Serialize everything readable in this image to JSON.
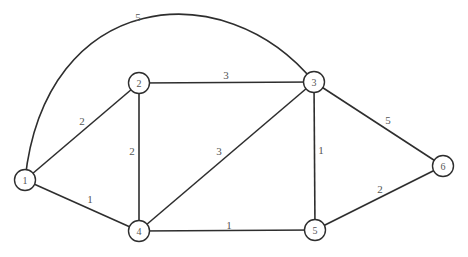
{
  "diagram": {
    "type": "weighted-undirected-graph",
    "nodes": [
      {
        "id": "1",
        "label": "1",
        "x": 25,
        "y": 180
      },
      {
        "id": "2",
        "label": "2",
        "x": 139,
        "y": 83
      },
      {
        "id": "3",
        "label": "3",
        "x": 314,
        "y": 82
      },
      {
        "id": "4",
        "label": "4",
        "x": 139,
        "y": 231
      },
      {
        "id": "5",
        "label": "5",
        "x": 315,
        "y": 230
      },
      {
        "id": "6",
        "label": "6",
        "x": 443,
        "y": 166
      }
    ],
    "edges": [
      {
        "from": "1",
        "to": "3",
        "weight": "5",
        "curved": true,
        "label_x": 138,
        "label_y": 17
      },
      {
        "from": "1",
        "to": "2",
        "weight": "2",
        "curved": false,
        "label_x": 82,
        "label_y": 121
      },
      {
        "from": "1",
        "to": "4",
        "weight": "1",
        "curved": false,
        "label_x": 90,
        "label_y": 199
      },
      {
        "from": "2",
        "to": "3",
        "weight": "3",
        "curved": false,
        "label_x": 226,
        "label_y": 75
      },
      {
        "from": "2",
        "to": "4",
        "weight": "2",
        "curved": false,
        "label_x": 132,
        "label_y": 151
      },
      {
        "from": "3",
        "to": "4",
        "weight": "3",
        "curved": false,
        "label_x": 219,
        "label_y": 151
      },
      {
        "from": "3",
        "to": "5",
        "weight": "1",
        "curved": false,
        "label_x": 321,
        "label_y": 150
      },
      {
        "from": "3",
        "to": "6",
        "weight": "5",
        "curved": false,
        "label_x": 388,
        "label_y": 120
      },
      {
        "from": "4",
        "to": "5",
        "weight": "1",
        "curved": false,
        "label_x": 229,
        "label_y": 225
      },
      {
        "from": "5",
        "to": "6",
        "weight": "2",
        "curved": false,
        "label_x": 380,
        "label_y": 189
      }
    ]
  }
}
